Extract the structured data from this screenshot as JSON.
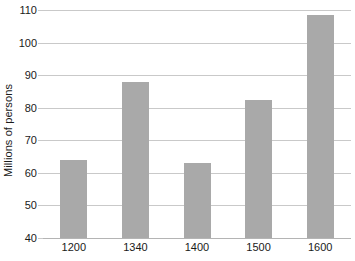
{
  "chart_data": {
    "type": "bar",
    "title": "",
    "subtitle": "",
    "xlabel": "",
    "ylabel": "Millions of persons",
    "categories": [
      "1200",
      "1340",
      "1400",
      "1500",
      "1600"
    ],
    "values": [
      64,
      88,
      63,
      82.5,
      108.5
    ],
    "series": [
      {
        "name": "Population",
        "values": [
          64,
          88,
          63,
          82.5,
          108.5
        ]
      }
    ],
    "ylim": [
      40,
      110
    ],
    "yticks": [
      40,
      50,
      60,
      70,
      80,
      90,
      100,
      110
    ],
    "ytick_labels": [
      "40",
      "50",
      "60",
      "70",
      "80",
      "90",
      "100",
      "110"
    ],
    "grid": true,
    "grid_axis": "y",
    "legend": false,
    "legend_position": "none",
    "annotations": [],
    "colors": {
      "bar": "#a9a9a9",
      "grid": "#c9c9c9",
      "axis": "#b4b4b4",
      "text": "#1a1a1a",
      "background": "#ffffff"
    }
  }
}
